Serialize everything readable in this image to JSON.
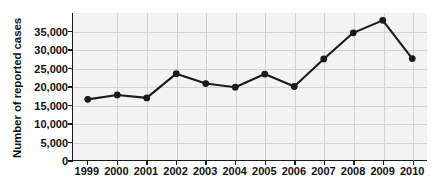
{
  "chart_data": {
    "type": "line",
    "title": "",
    "xlabel": "",
    "ylabel": "Number of reported cases",
    "x": [
      "1999",
      "2000",
      "2001",
      "2002",
      "2003",
      "2004",
      "2005",
      "2006",
      "2007",
      "2008",
      "2009",
      "2010"
    ],
    "categories": [
      "1999",
      "2000",
      "2001",
      "2002",
      "2003",
      "2004",
      "2005",
      "2006",
      "2007",
      "2008",
      "2009",
      "2010"
    ],
    "values": [
      16500,
      17700,
      16900,
      23500,
      20800,
      19800,
      23400,
      20000,
      27500,
      34600,
      38000,
      27600
    ],
    "series": [
      {
        "name": "Number of reported cases",
        "values": [
          16500,
          17700,
          16900,
          23500,
          20800,
          19800,
          23400,
          20000,
          27500,
          34600,
          38000,
          27600
        ]
      }
    ],
    "ylim": [
      0,
      40000
    ],
    "ytick_values": [
      0,
      5000,
      10000,
      15000,
      20000,
      25000,
      30000,
      35000
    ],
    "ytick_labels": [
      "0",
      "5,000",
      "10,000",
      "15,000",
      "20,000",
      "25,000",
      "30,000",
      "35,000"
    ],
    "grid": true,
    "legend": false,
    "legend_position": "none",
    "marker": "circle",
    "line_color": "#1a1a1a",
    "marker_color": "#1a1a1a",
    "plot_background": "#f3f3f3",
    "gridline_color": "#d2d2d2",
    "axis_color": "#1a1a1a"
  }
}
